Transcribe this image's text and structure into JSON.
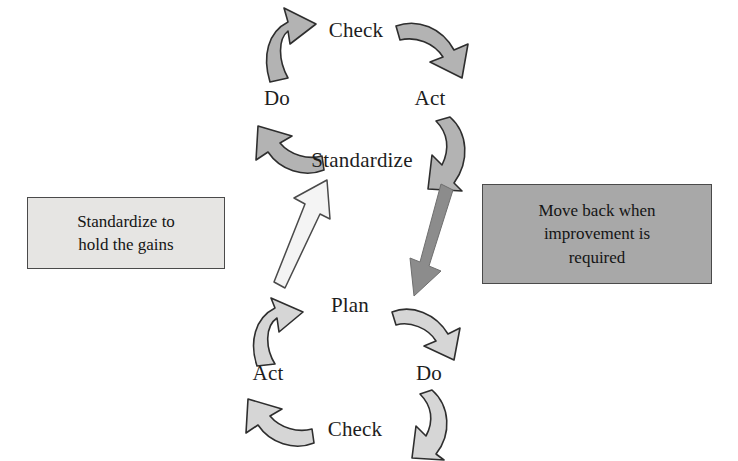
{
  "diagram": {
    "colors": {
      "curved_arrow_fill_upper": "#b3b3b3",
      "curved_arrow_fill_lower": "#d6d6d6",
      "curved_arrow_stroke": "#2e2e2e",
      "straight_arrow_up_fill": "#f2f2f2",
      "straight_arrow_down_fill": "#8c8c8c",
      "note_left_fill": "#e6e5e3",
      "note_right_fill": "#a8a8a8",
      "note_border": "#4a4a4a",
      "text": "#1d1d1d"
    },
    "upper_cycle": {
      "name": "SDCA cycle",
      "steps": [
        {
          "label": "Standardize"
        },
        {
          "label": "Do"
        },
        {
          "label": "Check"
        },
        {
          "label": "Act"
        }
      ]
    },
    "lower_cycle": {
      "name": "PDCA cycle",
      "steps": [
        {
          "label": "Plan"
        },
        {
          "label": "Do"
        },
        {
          "label": "Check"
        },
        {
          "label": "Act"
        }
      ]
    },
    "notes": {
      "left": {
        "line1": "Standardize to",
        "line2": "hold the gains"
      },
      "right": {
        "line1": "Move back when",
        "line2": "improvement is",
        "line3": "required"
      }
    },
    "connectors": {
      "up": {
        "name": "standardize-to-hold-gains-arrow"
      },
      "down": {
        "name": "move-back-for-improvement-arrow"
      }
    }
  }
}
